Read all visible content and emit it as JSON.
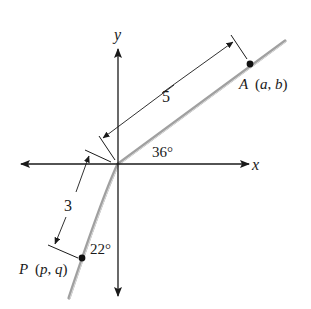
{
  "diagram": {
    "axes": {
      "x_label": "x",
      "y_label": "y"
    },
    "rays": {
      "ray_a": {
        "angle_label": "36°",
        "angle_deg": 36,
        "reference": "positive x-axis"
      },
      "ray_p": {
        "angle_label": "22°",
        "angle_deg": 22,
        "reference": "negative y-axis"
      }
    },
    "points": {
      "A": {
        "name": "A",
        "coords_label": "(a, b)",
        "open_paren": "(",
        "x_var": "a",
        "comma": ",",
        "y_var": "b",
        "close_paren": ")"
      },
      "P": {
        "name": "P",
        "coords_label": "(p, q)",
        "open_paren": "(",
        "x_var": "p",
        "comma": ",",
        "y_var": "q",
        "close_paren": ")"
      }
    },
    "dimensions": {
      "origin_to_A": {
        "label": "5"
      },
      "origin_to_P": {
        "label": "3"
      }
    },
    "colors": {
      "axis": "#1a1a1a",
      "ray": "#9a9a9a",
      "ray_highlight": "#d8d8d8",
      "point": "#111111"
    }
  }
}
